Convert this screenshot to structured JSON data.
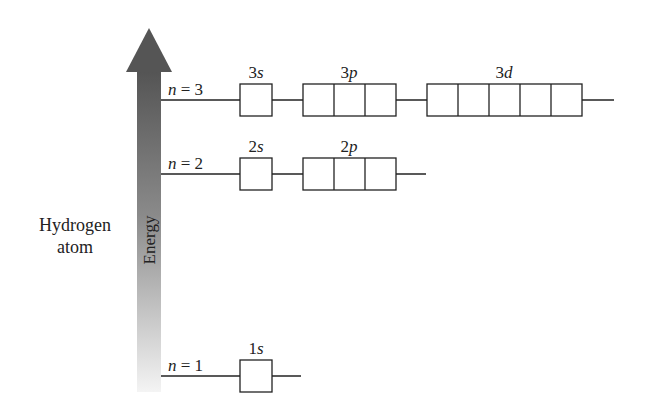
{
  "diagram": {
    "title_line1": "Hydrogen",
    "title_line2": "atom",
    "axis_label": "Energy",
    "colors": {
      "arrow_dark": "#545454",
      "arrow_light": "#f2f2f2",
      "line": "#222222"
    },
    "levels": [
      {
        "label": "n = 3",
        "n": "3",
        "subshells": [
          {
            "name": "3s",
            "num": "3",
            "letter": "s",
            "orbitals": 1
          },
          {
            "name": "3p",
            "num": "3",
            "letter": "p",
            "orbitals": 3
          },
          {
            "name": "3d",
            "num": "3",
            "letter": "d",
            "orbitals": 5
          }
        ]
      },
      {
        "label": "n = 2",
        "n": "2",
        "subshells": [
          {
            "name": "2s",
            "num": "2",
            "letter": "s",
            "orbitals": 1
          },
          {
            "name": "2p",
            "num": "2",
            "letter": "p",
            "orbitals": 3
          }
        ]
      },
      {
        "label": "n = 1",
        "n": "1",
        "subshells": [
          {
            "name": "1s",
            "num": "1",
            "letter": "s",
            "orbitals": 1
          }
        ]
      }
    ]
  }
}
